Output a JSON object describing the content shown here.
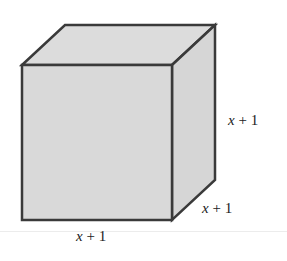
{
  "figure": {
    "type": "cube",
    "colors": {
      "face_fill": "#d9d9d9",
      "top_fill": "#dcdcdc",
      "side_fill": "#d6d6d6",
      "edge": "#3a3a3a"
    },
    "labels": {
      "height": {
        "var": "x",
        "rest": " + 1"
      },
      "depth": {
        "var": "x",
        "rest": " + 1"
      },
      "width": {
        "var": "x",
        "rest": " + 1"
      }
    }
  }
}
